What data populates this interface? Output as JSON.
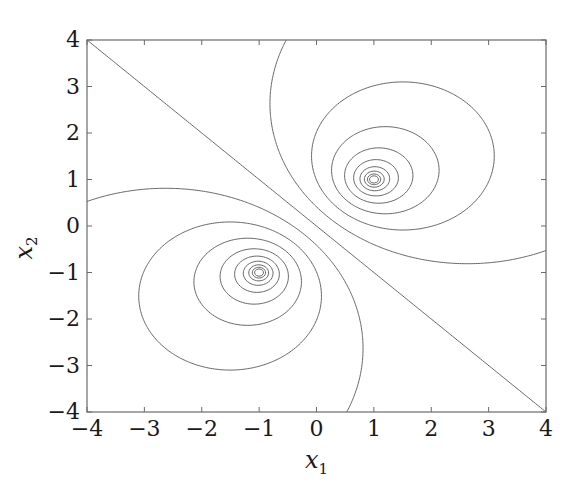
{
  "chart_data": {
    "type": "contour",
    "title": "",
    "xlabel": "x",
    "xlabel_sub": "1",
    "ylabel": "x",
    "ylabel_sub": "2",
    "xlim": [
      -4,
      4
    ],
    "ylim": [
      -4,
      4
    ],
    "x_ticks": [
      -4,
      -3,
      -2,
      -1,
      0,
      1,
      2,
      3,
      4
    ],
    "y_ticks": [
      -4,
      -3,
      -2,
      -1,
      0,
      1,
      2,
      3,
      4
    ],
    "x_tick_labels": [
      "−4",
      "−3",
      "−2",
      "−1",
      "0",
      "1",
      "2",
      "3",
      "4"
    ],
    "y_tick_labels": [
      "−4",
      "−3",
      "−2",
      "−1",
      "0",
      "1",
      "2",
      "3",
      "4"
    ],
    "grid": false,
    "legend": null,
    "line_color": "#555555",
    "centers": [
      [
        1,
        1
      ],
      [
        -1,
        -1
      ]
    ],
    "function": "ln(((x1-1)^2+(x2-1)^2)/((x1+1)^2+(x2+1)^2))",
    "levels": [
      -7.2,
      -6.4,
      -5.6,
      -4.8,
      -4.0,
      -3.2,
      -2.4,
      -1.6,
      -0.8,
      0,
      0.8,
      1.6,
      2.4,
      3.2,
      4.0,
      4.8,
      5.6,
      6.4,
      7.2
    ]
  },
  "plot_area": {
    "left": 87,
    "top": 40,
    "right": 546,
    "bottom": 412
  }
}
